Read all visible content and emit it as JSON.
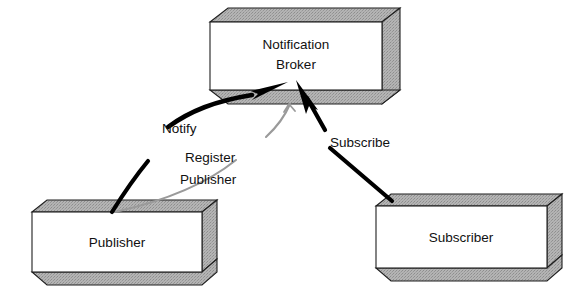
{
  "diagram": {
    "background_color": "#ffffff",
    "shading_color": "#a8a8a8",
    "outline_color": "#1f1f1f",
    "thick_edge_color": "#000000",
    "thin_edge_color": "#9a9a9a",
    "nodes": [
      {
        "id": "notification-broker",
        "label_line1": "Notification",
        "label_line2": "Broker",
        "shape": "3d-box"
      },
      {
        "id": "publisher",
        "label_line1": "Publisher",
        "label_line2": "",
        "shape": "3d-box"
      },
      {
        "id": "subscriber",
        "label_line1": "Subscriber",
        "label_line2": "",
        "shape": "3d-box"
      }
    ],
    "edges": [
      {
        "id": "notify",
        "label_line1": "Notify",
        "label_line2": "",
        "from": "publisher",
        "to": "notification-broker",
        "style": "thick-curved-solid-arrow"
      },
      {
        "id": "register-publisher",
        "label_line1": "Register",
        "label_line2": "Publisher",
        "from": "publisher",
        "to": "notification-broker",
        "style": "thin-gray-line"
      },
      {
        "id": "subscribe",
        "label_line1": "Subscribe",
        "label_line2": "",
        "from": "subscriber",
        "to": "notification-broker",
        "style": "thick-straight-solid-arrow"
      }
    ]
  }
}
